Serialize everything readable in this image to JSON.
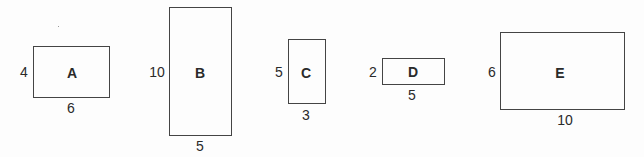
{
  "diagram": {
    "type": "rectangles-with-dimensions",
    "rectangles": [
      {
        "name": "A",
        "height_label": "4",
        "width_label": "6"
      },
      {
        "name": "B",
        "height_label": "10",
        "width_label": "5"
      },
      {
        "name": "C",
        "height_label": "5",
        "width_label": "3"
      },
      {
        "name": "D",
        "height_label": "2",
        "width_label": "5"
      },
      {
        "name": "E",
        "height_label": "6",
        "width_label": "10"
      }
    ]
  }
}
